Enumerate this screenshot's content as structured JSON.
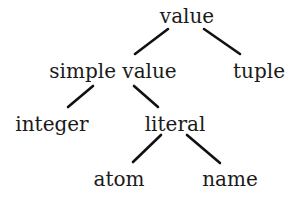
{
  "diagram": {
    "type": "tree",
    "nodes": [
      {
        "id": "value",
        "label": "value",
        "cx": 187,
        "y": 6
      },
      {
        "id": "simple_value",
        "label": "simple value",
        "cx": 113,
        "y": 61
      },
      {
        "id": "tuple",
        "label": "tuple",
        "cx": 259,
        "y": 61
      },
      {
        "id": "integer",
        "label": "integer",
        "cx": 52,
        "y": 114
      },
      {
        "id": "literal",
        "label": "literal",
        "cx": 175,
        "y": 114
      },
      {
        "id": "atom",
        "label": "atom",
        "cx": 119,
        "y": 169
      },
      {
        "id": "name",
        "label": "name",
        "cx": 230,
        "y": 169
      }
    ],
    "edges": [
      {
        "from": "value",
        "to": "simple_value",
        "x1": 168,
        "y1": 29,
        "x2": 135,
        "y2": 54
      },
      {
        "from": "value",
        "to": "tuple",
        "x1": 204,
        "y1": 29,
        "x2": 240,
        "y2": 54
      },
      {
        "from": "simple_value",
        "to": "integer",
        "x1": 93,
        "y1": 86,
        "x2": 68,
        "y2": 107
      },
      {
        "from": "simple_value",
        "to": "literal",
        "x1": 134,
        "y1": 86,
        "x2": 158,
        "y2": 107
      },
      {
        "from": "literal",
        "to": "atom",
        "x1": 161,
        "y1": 135,
        "x2": 133,
        "y2": 162
      },
      {
        "from": "literal",
        "to": "name",
        "x1": 187,
        "y1": 135,
        "x2": 220,
        "y2": 163
      }
    ],
    "colors": {
      "text": "#1a1a1a",
      "edge": "#111111",
      "background": "#ffffff"
    }
  }
}
